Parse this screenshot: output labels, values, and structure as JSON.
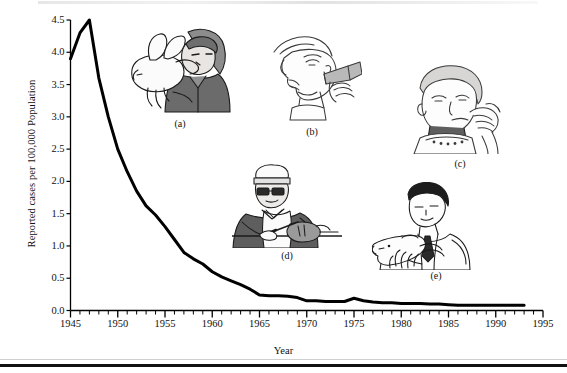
{
  "figure": {
    "axis": {
      "y_label": "Reported cases per 100,000 Population",
      "x_label": "Year"
    },
    "illustration_captions": [
      {
        "id": "a",
        "label": "(a)",
        "alt": "child holding a pet rabbit close to face"
      },
      {
        "id": "b",
        "label": "(b)",
        "alt": "person drinking from a bottle"
      },
      {
        "id": "c",
        "label": "(c)",
        "alt": "person eating food held in hand"
      },
      {
        "id": "d",
        "label": "(d)",
        "alt": "butcher in cap and apron cutting meat"
      },
      {
        "id": "e",
        "label": "(e)",
        "alt": "veterinarian examining a dog"
      }
    ]
  },
  "chart_data": {
    "type": "line",
    "title": "",
    "xlabel": "Year",
    "ylabel": "Reported cases per 100,000 Population",
    "xlim": [
      1945,
      1995
    ],
    "ylim": [
      0.0,
      4.5
    ],
    "grid": false,
    "legend": "none",
    "x_major_ticks": [
      1945,
      1950,
      1955,
      1960,
      1965,
      1970,
      1975,
      1980,
      1985,
      1990,
      1995
    ],
    "x_minor_tick_interval": 1,
    "y_ticks": [
      0.0,
      0.5,
      1.0,
      1.5,
      2.0,
      2.5,
      3.0,
      3.5,
      4.0,
      4.5
    ],
    "y_tick_labels": [
      "0.0",
      "0.5",
      "1.0",
      "1.5",
      "2.0",
      "2.5",
      "3.0",
      "3.5",
      "4.0",
      "4.5"
    ],
    "series": [
      {
        "name": "Reported cases per 100,000 population",
        "x": [
          1945,
          1946,
          1947,
          1948,
          1949,
          1950,
          1951,
          1952,
          1953,
          1954,
          1955,
          1956,
          1957,
          1958,
          1959,
          1960,
          1961,
          1962,
          1963,
          1964,
          1965,
          1966,
          1967,
          1968,
          1969,
          1970,
          1971,
          1972,
          1973,
          1974,
          1975,
          1976,
          1977,
          1978,
          1979,
          1980,
          1981,
          1982,
          1983,
          1984,
          1985,
          1986,
          1987,
          1988,
          1989,
          1990,
          1991,
          1992,
          1993
        ],
        "y": [
          3.9,
          4.3,
          4.5,
          3.6,
          3.0,
          2.5,
          2.15,
          1.85,
          1.62,
          1.48,
          1.3,
          1.1,
          0.9,
          0.8,
          0.72,
          0.6,
          0.52,
          0.46,
          0.4,
          0.33,
          0.24,
          0.23,
          0.23,
          0.22,
          0.2,
          0.15,
          0.15,
          0.14,
          0.14,
          0.14,
          0.19,
          0.15,
          0.13,
          0.12,
          0.12,
          0.11,
          0.11,
          0.11,
          0.1,
          0.1,
          0.09,
          0.08,
          0.08,
          0.08,
          0.08,
          0.08,
          0.08,
          0.08,
          0.08
        ]
      }
    ],
    "colors": {
      "line": "#000000",
      "axis": "#000000",
      "background": "#ffffff"
    },
    "line_width_px": 3
  }
}
